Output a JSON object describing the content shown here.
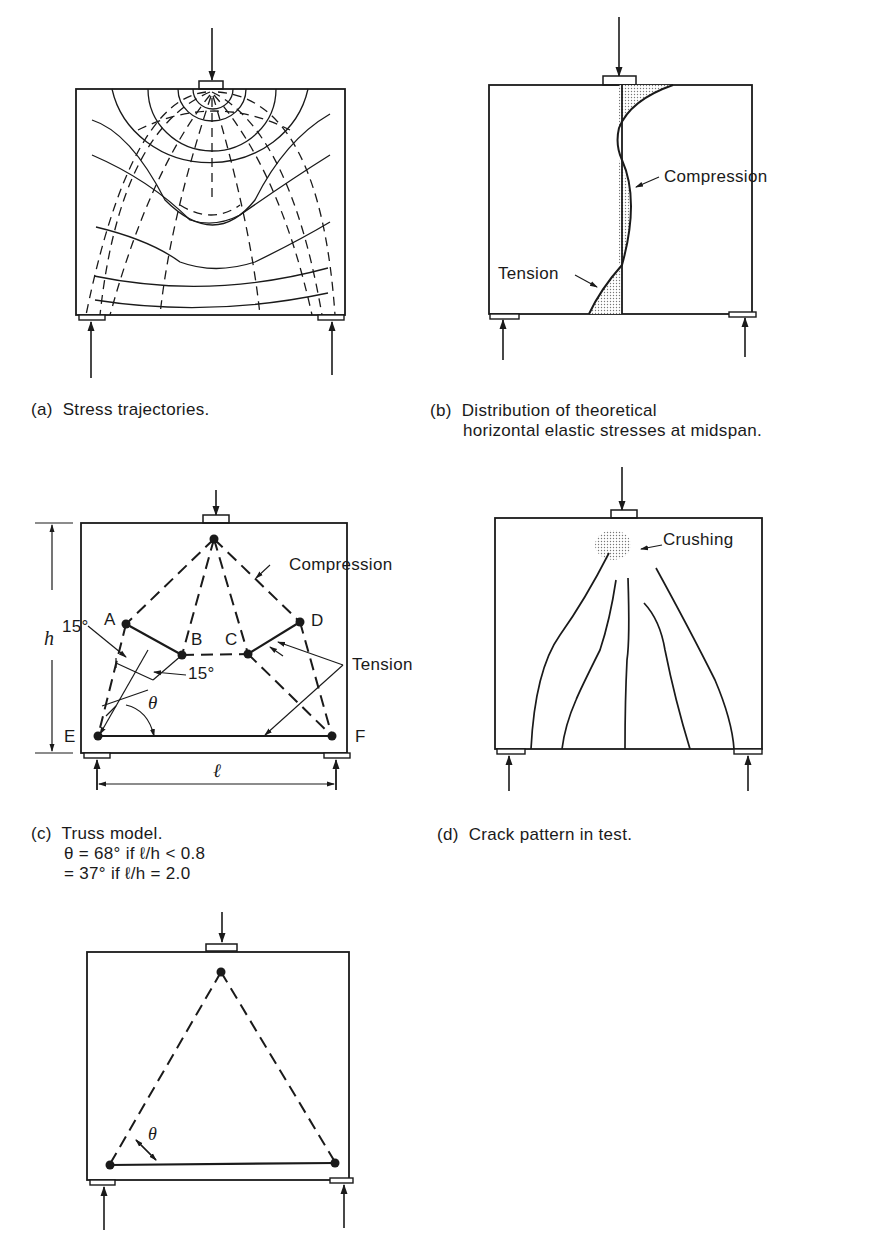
{
  "figure": {
    "panels": [
      {
        "id": "a",
        "caption_tag": "(a)",
        "caption": "Stress trajectories."
      },
      {
        "id": "b",
        "caption_tag": "(b)",
        "caption_line1": "Distribution of theoretical",
        "caption_line2": "horizontal elastic stresses at midspan.",
        "labels": {
          "compression": "Compression",
          "tension": "Tension"
        }
      },
      {
        "id": "c",
        "caption_tag": "(c)",
        "caption": "Truss model.",
        "eq_line1": "θ = 68° if ℓ/h < 0.8",
        "eq_line2": "= 37° if ℓ/h = 2.0",
        "labels": {
          "compression": "Compression",
          "tension": "Tension",
          "node_a": "A",
          "node_b": "B",
          "node_c": "C",
          "node_d": "D",
          "node_e": "E",
          "node_f": "F",
          "angle_top": "15°",
          "angle_mid": "15°",
          "theta": "θ",
          "height": "h",
          "span": "ℓ"
        }
      },
      {
        "id": "d",
        "caption_tag": "(d)",
        "caption": "Crack pattern in test.",
        "labels": {
          "crushing": "Crushing"
        }
      },
      {
        "id": "e",
        "labels": {
          "theta": "θ"
        }
      }
    ]
  }
}
